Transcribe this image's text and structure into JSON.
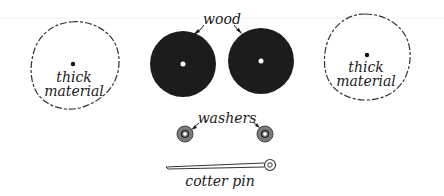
{
  "diagram": {
    "labels": {
      "left_material": [
        "thick",
        "material"
      ],
      "right_material": [
        "thick",
        "material"
      ],
      "wood": "wood",
      "washers": "washers",
      "cotter_pin": "cotter pin"
    },
    "colors": {
      "wood": "#1c1c1c",
      "washer": "#7a7a7a",
      "outline": "#333333",
      "background": "#ffffff"
    }
  }
}
